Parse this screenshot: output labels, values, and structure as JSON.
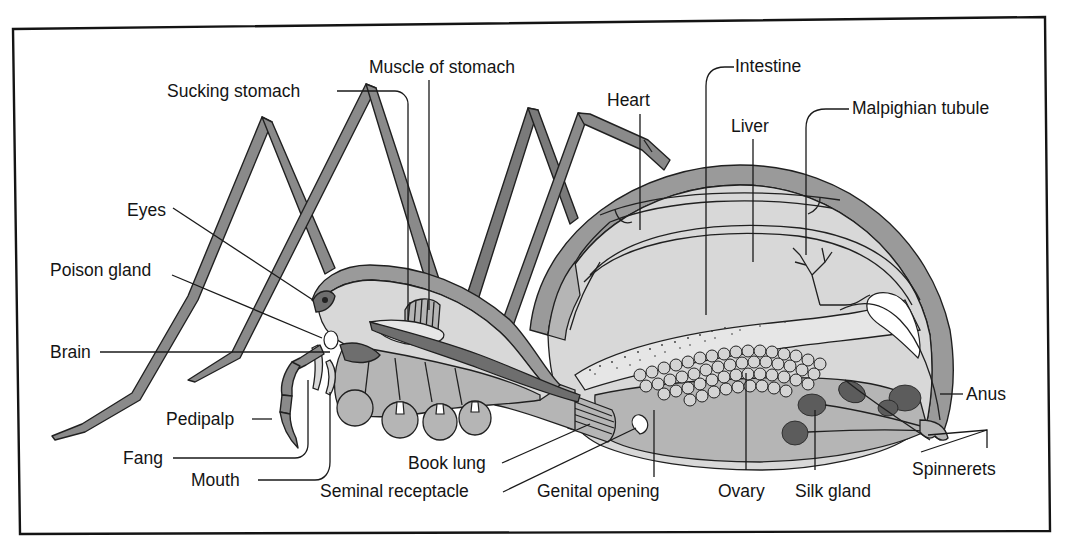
{
  "figure": {
    "colors": {
      "ink": "#141414",
      "light_fill": "#d8d8d8",
      "mid_fill": "#9a9a9a",
      "background": "#ffffff"
    }
  },
  "labels": {
    "sucking_stomach": "Sucking stomach",
    "muscle_of_stomach": "Muscle of stomach",
    "intestine": "Intestine",
    "heart": "Heart",
    "liver": "Liver",
    "malpighian_tubule": "Malpighian tubule",
    "eyes": "Eyes",
    "poison_gland": "Poison gland",
    "brain": "Brain",
    "pedipalp": "Pedipalp",
    "fang": "Fang",
    "mouth": "Mouth",
    "book_lung": "Book lung",
    "seminal_receptacle": "Seminal receptacle",
    "genital_opening": "Genital opening",
    "ovary": "Ovary",
    "silk_gland": "Silk gland",
    "anus": "Anus",
    "spinnerets": "Spinnerets"
  }
}
